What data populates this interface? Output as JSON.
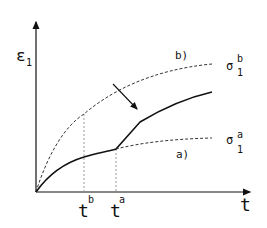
{
  "axes": {
    "y_label": "ε",
    "y_label_sub": "1",
    "x_label": "t"
  },
  "ticks": {
    "tb": {
      "base": "t",
      "sup": "b"
    },
    "ta": {
      "base": "t",
      "sup": "a"
    }
  },
  "curves": {
    "b": {
      "label": "b)",
      "end_label": "σ",
      "end_sup": "b",
      "end_sub": "1",
      "style": "dashed"
    },
    "a": {
      "label": "a)",
      "end_label": "σ",
      "end_sup": "a",
      "end_sub": "1",
      "style": "dashed"
    },
    "main": {
      "style": "solid"
    }
  },
  "colors": {
    "ink": "#111111",
    "dashed": "#333333",
    "guide": "#999999"
  }
}
